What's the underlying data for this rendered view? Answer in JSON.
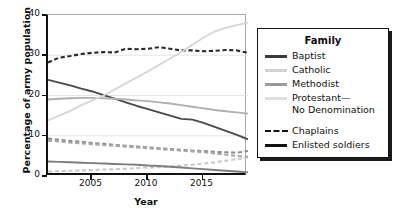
{
  "chart_data": {
    "type": "line",
    "title": "",
    "xlabel": "Year",
    "ylabel": "Percentage of army population",
    "xlim": [
      2001,
      2019
    ],
    "ylim": [
      0,
      40
    ],
    "yticks": [
      0,
      10,
      20,
      30,
      40
    ],
    "xticks": [
      2005,
      2010,
      2015
    ],
    "grid": "horizontal-light",
    "legend_position": "right-outside",
    "legend_title": "Family",
    "x": [
      2001,
      2002,
      2003,
      2004,
      2005,
      2006,
      2007,
      2008,
      2009,
      2010,
      2011,
      2012,
      2013,
      2014,
      2015,
      2016,
      2017,
      2018,
      2019
    ],
    "series": [
      {
        "name": "Baptist — Chaplains",
        "family": "Baptist",
        "group": "Chaplains",
        "style": "dashed",
        "color": "#2b2b2b",
        "values": [
          28.2,
          29.4,
          29.8,
          30.3,
          30.6,
          30.8,
          30.7,
          31.6,
          31.5,
          31.6,
          32.0,
          31.6,
          31.2,
          31.2,
          31.0,
          31.1,
          31.3,
          31.2,
          30.6
        ]
      },
      {
        "name": "Baptist — Enlisted soldiers",
        "family": "Baptist",
        "group": "Enlisted soldiers",
        "style": "solid",
        "color": "#4a4a4a",
        "values": [
          23.9,
          23.2,
          22.5,
          21.7,
          21.0,
          20.1,
          19.2,
          18.3,
          17.4,
          16.6,
          15.8,
          15.0,
          14.2,
          14.0,
          13.2,
          12.2,
          11.2,
          10.2,
          9.1
        ]
      },
      {
        "name": "Catholic — Chaplains",
        "family": "Catholic",
        "group": "Chaplains",
        "style": "dashed",
        "color": "#c9c9c9",
        "values": [
          1.1,
          1.2,
          1.3,
          1.4,
          1.5,
          1.6,
          1.7,
          1.8,
          2.0,
          2.1,
          2.2,
          2.4,
          2.6,
          2.8,
          3.1,
          3.4,
          3.8,
          4.2,
          4.6
        ]
      },
      {
        "name": "Catholic — Enlisted soldiers",
        "family": "Catholic",
        "group": "Enlisted soldiers",
        "style": "solid",
        "color": "#b0b0b0",
        "values": [
          19.0,
          19.2,
          19.3,
          19.4,
          19.4,
          19.3,
          19.2,
          19.0,
          18.8,
          18.6,
          18.3,
          18.0,
          17.6,
          17.2,
          16.8,
          16.4,
          16.1,
          15.8,
          15.5
        ]
      },
      {
        "name": "Methodist — Chaplains",
        "family": "Methodist",
        "group": "Chaplains",
        "style": "dashed",
        "color": "#8e8e8e",
        "values": [
          9.3,
          9.0,
          8.7,
          8.5,
          8.2,
          8.0,
          7.7,
          7.5,
          7.3,
          7.1,
          6.9,
          6.7,
          6.5,
          6.3,
          6.2,
          6.0,
          5.9,
          5.8,
          6.2
        ]
      },
      {
        "name": "Methodist — Enlisted soldiers",
        "family": "Methodist",
        "group": "Enlisted soldiers",
        "style": "solid",
        "color": "#7d7d7d",
        "values": [
          3.6,
          3.5,
          3.4,
          3.3,
          3.2,
          3.1,
          3.0,
          2.9,
          2.8,
          2.6,
          2.5,
          2.3,
          2.1,
          1.9,
          1.7,
          1.5,
          1.3,
          1.1,
          0.9
        ]
      },
      {
        "name": "Protestant—No Denomination — Chaplains",
        "family": "Protestant—No Denomination",
        "group": "Chaplains",
        "style": "dashed",
        "color": "#a8a8a8",
        "values": [
          8.8,
          8.6,
          8.3,
          8.1,
          7.9,
          7.7,
          7.5,
          7.3,
          7.1,
          6.9,
          6.7,
          6.5,
          6.3,
          6.1,
          5.9,
          5.6,
          5.3,
          5.0,
          4.8
        ]
      },
      {
        "name": "Protestant—No Denomination — Enlisted soldiers",
        "family": "Protestant—No Denomination",
        "group": "Enlisted soldiers",
        "style": "solid",
        "color": "#d6d6d6",
        "values": [
          13.8,
          15.0,
          16.2,
          17.6,
          18.8,
          20.0,
          21.5,
          23.0,
          24.5,
          26.0,
          27.6,
          29.2,
          30.8,
          32.6,
          34.4,
          35.9,
          36.8,
          37.5,
          38.1
        ]
      }
    ]
  },
  "axes": {
    "ylabel": "Percentage of army population",
    "xlabel": "Year",
    "ytick_labels": [
      "0",
      "10",
      "20",
      "30",
      "40"
    ],
    "xtick_labels": [
      "2005",
      "2010",
      "2015"
    ]
  },
  "legend": {
    "title": "Family",
    "families": [
      {
        "label": "Baptist",
        "color": "#3a3a3a"
      },
      {
        "label": "Catholic",
        "color": "#d2d2d2"
      },
      {
        "label": "Methodist",
        "color": "#9a9a9a"
      },
      {
        "label": "Protestant—",
        "label2": "No Denomination",
        "color": "#e0e0e0"
      }
    ],
    "groups": [
      {
        "label": "Chaplains",
        "style": "dashed",
        "color": "#111111"
      },
      {
        "label": "Enlisted soldiers",
        "style": "solid",
        "color": "#111111"
      }
    ]
  }
}
